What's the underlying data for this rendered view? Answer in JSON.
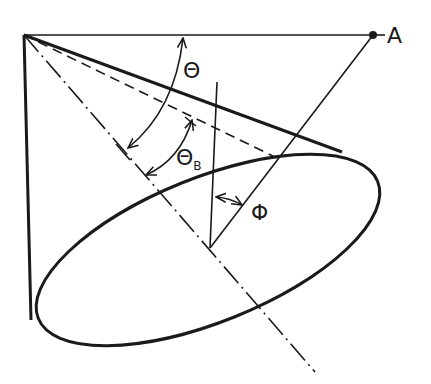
{
  "diagram": {
    "labels": {
      "point_a": "A",
      "theta": "Θ",
      "theta_b_main": "Θ",
      "theta_b_sub": "B",
      "phi": "Φ"
    },
    "colors": {
      "stroke": "#1a1a1a",
      "background": "#ffffff"
    },
    "points": {
      "apex": [
        24,
        35
      ],
      "a": [
        373,
        35
      ],
      "pivot": [
        210,
        248
      ]
    },
    "ellipse": {
      "cx": 208,
      "cy": 250,
      "rx": 183,
      "ry": 72,
      "rotation": -22
    }
  }
}
